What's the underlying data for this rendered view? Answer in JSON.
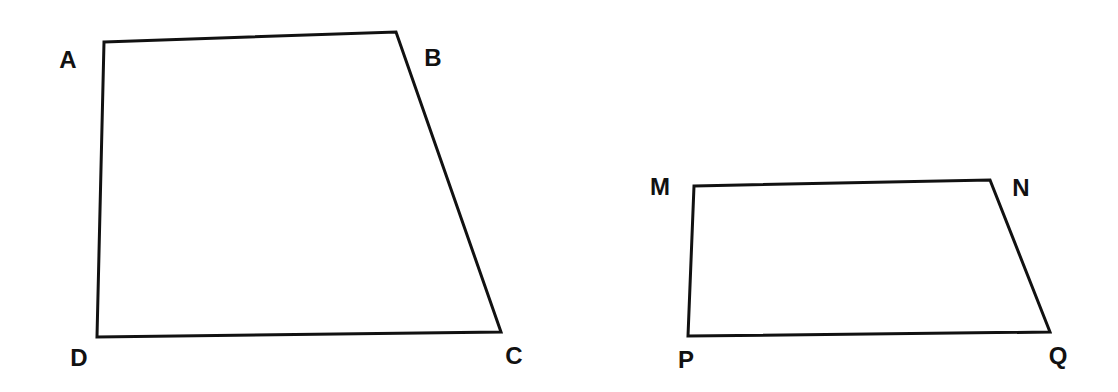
{
  "diagram": {
    "type": "geometry",
    "background": "#ffffff",
    "stroke_color": "#111111",
    "shapes": [
      {
        "name": "quadrilateral ABCD",
        "vertices": [
          {
            "label": "A",
            "x": 104,
            "y": 42,
            "lx": 68,
            "ly": 68
          },
          {
            "label": "B",
            "x": 396,
            "y": 32,
            "lx": 433,
            "ly": 66
          },
          {
            "label": "C",
            "x": 501,
            "y": 332,
            "lx": 514,
            "ly": 364
          },
          {
            "label": "D",
            "x": 97,
            "y": 337,
            "lx": 79,
            "ly": 366
          }
        ]
      },
      {
        "name": "quadrilateral MNQP",
        "vertices": [
          {
            "label": "M",
            "x": 694,
            "y": 186,
            "lx": 660,
            "ly": 195
          },
          {
            "label": "N",
            "x": 990,
            "y": 180,
            "lx": 1021,
            "ly": 196
          },
          {
            "label": "Q",
            "x": 1050,
            "y": 332,
            "lx": 1058,
            "ly": 364
          },
          {
            "label": "P",
            "x": 688,
            "y": 336,
            "lx": 686,
            "ly": 368
          }
        ]
      }
    ]
  }
}
